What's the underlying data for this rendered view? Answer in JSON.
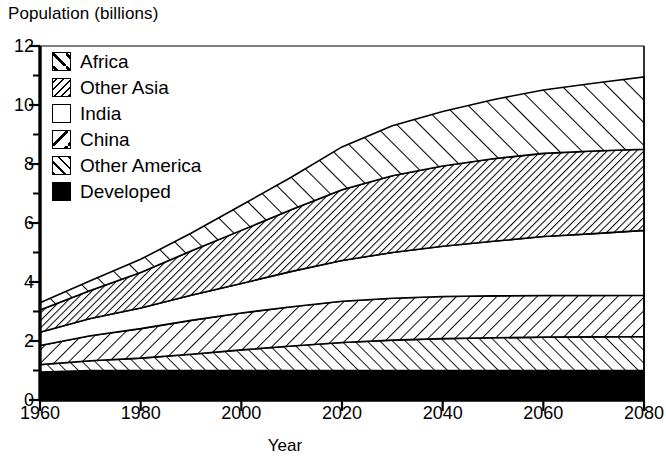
{
  "chart_data": {
    "type": "area",
    "title": "",
    "ylabel": "Population (billions)",
    "xlabel": "Year",
    "stacked": true,
    "grid": false,
    "legend_position": "top-left inside plot",
    "xlim": [
      1960,
      2080
    ],
    "ylim": [
      0,
      12
    ],
    "x_ticks": [
      1960,
      1980,
      2000,
      2020,
      2040,
      2060,
      2080
    ],
    "y_ticks": [
      0,
      2,
      4,
      6,
      8,
      10,
      12
    ],
    "y_minor_ticks": [
      1,
      3,
      5,
      7,
      9,
      11
    ],
    "x": [
      1960,
      1970,
      1980,
      1990,
      2000,
      2010,
      2020,
      2030,
      2040,
      2050,
      2060,
      2070,
      2080
    ],
    "series": [
      {
        "name": "Developed",
        "pattern": "solid-black",
        "values": [
          0.95,
          1.0,
          1.0,
          1.0,
          1.0,
          1.0,
          1.0,
          1.0,
          1.0,
          1.0,
          1.0,
          1.0,
          1.0
        ]
      },
      {
        "name": "Other America",
        "pattern": "forward-hatch",
        "values": [
          0.25,
          0.33,
          0.42,
          0.55,
          0.7,
          0.83,
          0.95,
          1.03,
          1.08,
          1.11,
          1.13,
          1.14,
          1.15
        ]
      },
      {
        "name": "China",
        "pattern": "back-hatch",
        "values": [
          0.65,
          0.85,
          1.0,
          1.15,
          1.25,
          1.33,
          1.4,
          1.42,
          1.43,
          1.42,
          1.41,
          1.4,
          1.4
        ]
      },
      {
        "name": "India",
        "pattern": "white",
        "values": [
          0.45,
          0.58,
          0.7,
          0.85,
          1.0,
          1.2,
          1.38,
          1.55,
          1.7,
          1.85,
          2.0,
          2.1,
          2.2
        ]
      },
      {
        "name": "Other Asia",
        "pattern": "dense-back-hatch",
        "values": [
          0.75,
          0.95,
          1.2,
          1.5,
          1.8,
          2.1,
          2.4,
          2.6,
          2.72,
          2.8,
          2.82,
          2.8,
          2.75
        ]
      },
      {
        "name": "Africa",
        "pattern": "wide-forward-hatch",
        "values": [
          0.25,
          0.33,
          0.45,
          0.6,
          0.85,
          1.1,
          1.45,
          1.7,
          1.85,
          2.0,
          2.15,
          2.3,
          2.45
        ]
      }
    ],
    "cumulative_tops": {
      "Developed": [
        0.95,
        1.0,
        1.0,
        1.0,
        1.0,
        1.0,
        1.0,
        1.0,
        1.0,
        1.0,
        1.0,
        1.0,
        1.0
      ],
      "Other America": [
        1.2,
        1.33,
        1.42,
        1.55,
        1.7,
        1.83,
        1.95,
        2.03,
        2.08,
        2.11,
        2.13,
        2.14,
        2.15
      ],
      "China": [
        1.85,
        2.18,
        2.42,
        2.7,
        2.95,
        3.16,
        3.35,
        3.45,
        3.51,
        3.53,
        3.54,
        3.54,
        3.55
      ],
      "India": [
        2.3,
        2.76,
        3.12,
        3.55,
        3.95,
        4.36,
        4.73,
        5.0,
        5.21,
        5.38,
        5.54,
        5.64,
        5.75
      ],
      "Other Asia": [
        3.05,
        3.71,
        4.32,
        5.05,
        5.75,
        6.46,
        7.13,
        7.6,
        7.93,
        8.18,
        8.36,
        8.44,
        8.5
      ],
      "Africa": [
        3.3,
        4.04,
        4.77,
        5.65,
        6.6,
        7.56,
        8.58,
        9.3,
        9.78,
        10.18,
        10.51,
        10.74,
        10.95
      ]
    }
  },
  "axes": {
    "y_title": "Population (billions)",
    "x_title": "Year",
    "y_tick_labels": [
      "12",
      "10",
      "8",
      "6",
      "4",
      "2",
      "0"
    ],
    "x_tick_labels": [
      "1960",
      "1980",
      "2000",
      "2020",
      "2040",
      "2060",
      "2080"
    ]
  },
  "legend": {
    "items": [
      {
        "label": "Africa",
        "swatch": "wide-forward-hatch-swatch"
      },
      {
        "label": "Other Asia",
        "swatch": "dense-back-hatch-swatch"
      },
      {
        "label": "India",
        "swatch": "white-swatch"
      },
      {
        "label": "China",
        "swatch": "single-back-diagonal-swatch"
      },
      {
        "label": "Other America",
        "swatch": "forward-hatch-swatch"
      },
      {
        "label": "Developed",
        "swatch": "solid-black-swatch"
      }
    ]
  },
  "colors": {
    "ink": "#000000",
    "paper": "#ffffff"
  }
}
